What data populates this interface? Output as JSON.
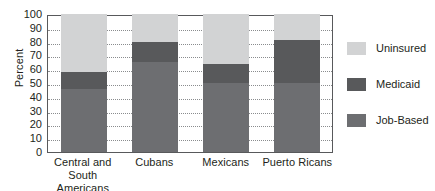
{
  "chart_data": {
    "type": "bar",
    "subtype": "stacked-bar",
    "title": "",
    "xlabel": "",
    "ylabel": "Percent",
    "ylim": [
      0,
      100
    ],
    "ytick_step": 10,
    "yticks": [
      100,
      90,
      80,
      70,
      60,
      50,
      40,
      30,
      20,
      10,
      0
    ],
    "grid": true,
    "grid_axis": "y",
    "legend_position": "right",
    "categories": [
      "Central and South Americans",
      "Cubans",
      "Mexicans",
      "Puerto Ricans"
    ],
    "category_lines": [
      [
        "Central and South",
        "Americans"
      ],
      [
        "Cubans",
        ""
      ],
      [
        "Mexicans",
        ""
      ],
      [
        "Puerto Ricans",
        ""
      ]
    ],
    "series": [
      {
        "name": "Job-Based",
        "color": "#6d6e71",
        "values": [
          46,
          65,
          50,
          50
        ]
      },
      {
        "name": "Medicaid",
        "color": "#58595b",
        "values": [
          12,
          15,
          14,
          31
        ]
      },
      {
        "name": "Uninsured",
        "color": "#d2d3d4",
        "values": [
          42,
          20,
          36,
          19
        ]
      }
    ],
    "cumulative_tops": {
      "job_based": [
        46,
        65,
        50,
        50
      ],
      "medicaid": [
        58,
        80,
        64,
        81
      ],
      "uninsured": [
        100,
        100,
        100,
        100
      ]
    }
  },
  "legend": {
    "items": [
      {
        "label": "Uninsured",
        "color": "#d2d3d4"
      },
      {
        "label": "Medicaid",
        "color": "#58595b"
      },
      {
        "label": "Job-Based",
        "color": "#6d6e71"
      }
    ]
  },
  "axes": {
    "y_title": "Percent"
  },
  "colors": {
    "axis": "#58595b",
    "grid": "#8a8c8e",
    "text": "#231f20",
    "background": "#ffffff"
  }
}
